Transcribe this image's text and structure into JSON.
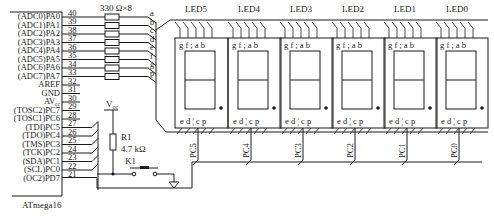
{
  "chip": {
    "name": "ATmega16",
    "pins_left": [
      {
        "label": "(ADC0)PA0",
        "num": "40",
        "y": 16
      },
      {
        "label": "(ADC1)PA1",
        "num": "39",
        "y": 24.5
      },
      {
        "label": "(ADC2)PA2",
        "num": "38",
        "y": 33
      },
      {
        "label": "(ADC3)PA3",
        "num": "37",
        "y": 41.5
      },
      {
        "label": "(ADC4)PA4",
        "num": "36",
        "y": 50
      },
      {
        "label": "(ADC5)PA5",
        "num": "35",
        "y": 58.5
      },
      {
        "label": "(ADC6)PA6",
        "num": "34",
        "y": 67
      },
      {
        "label": "(ADC7)PA7",
        "num": "33",
        "y": 75.5
      },
      {
        "label": "AREF",
        "num": "32",
        "y": 84
      },
      {
        "label": "GND",
        "num": "31",
        "y": 92.5
      },
      {
        "label": "AV",
        "num": "30",
        "y": 101,
        "sub": "cc"
      },
      {
        "label": "(TOSC2)PC7",
        "num": "29",
        "y": 109.5
      },
      {
        "label": "(TOSC1)PC6",
        "num": "28",
        "y": 118
      },
      {
        "label": "(TDI)PC5",
        "num": "27",
        "y": 126.5
      },
      {
        "label": "(TDO)PC4",
        "num": "26",
        "y": 135
      },
      {
        "label": "(TMS)PC3",
        "num": "25",
        "y": 143.5
      },
      {
        "label": "(TCK)PC2",
        "num": "24",
        "y": 152
      },
      {
        "label": "(SDA)PC1",
        "num": "23",
        "y": 160.5
      },
      {
        "label": "(SCL)PC0",
        "num": "22",
        "y": 169
      },
      {
        "label": "(OC2)PD7",
        "num": "21",
        "y": 177.5
      }
    ]
  },
  "resistor_array": {
    "label": "330 Ω×8",
    "segments": [
      "a",
      "b",
      "c",
      "d",
      "e",
      "f",
      "g",
      "p"
    ]
  },
  "pullup": {
    "vcc": "V",
    "vcc_sub": "cc",
    "resistor_name": "R1",
    "resistor_value": "4.7 kΩ",
    "switch_name": "K1"
  },
  "displays": [
    {
      "name": "LED5",
      "common": "PC5",
      "x": 175
    },
    {
      "name": "LED4",
      "common": "PC4",
      "x": 228
    },
    {
      "name": "LED3",
      "common": "PC3",
      "x": 280
    },
    {
      "name": "LED2",
      "common": "PC2",
      "x": 332
    },
    {
      "name": "LED1",
      "common": "PC1",
      "x": 384
    },
    {
      "name": "LED0",
      "common": "PC0",
      "x": 436
    }
  ],
  "led_pins_top": "g f ; a b",
  "led_pins_bottom": "e d ¦ c p"
}
